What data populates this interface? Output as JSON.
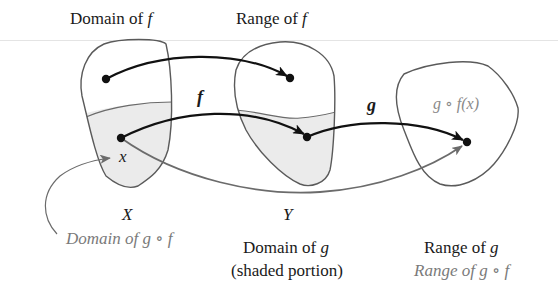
{
  "diagram": {
    "title_domain_f": {
      "text": "Domain of ",
      "var": "f"
    },
    "title_range_f": {
      "text": "Range of ",
      "var": "f"
    },
    "function_labels": {
      "f": "f",
      "g": "g"
    },
    "point_labels": {
      "x": "x",
      "gof_x": "g ∘ f(x)"
    },
    "set_labels": {
      "X": "X",
      "Y": "Y"
    },
    "captions": {
      "domain_gof": "Domain of g ∘ f",
      "domain_g_line1": {
        "text": "Domain of ",
        "var": "g"
      },
      "domain_g_line2": "(shaded portion)",
      "range_g": {
        "text": "Range of ",
        "var": "g"
      },
      "range_gof": "Range of g ∘ f"
    },
    "colors": {
      "outline": "#5a5a5a",
      "shade": "#ebebeb",
      "arrow_primary": "#111111",
      "arrow_secondary": "#6b6b6b",
      "secondary_text": "#7a7a7a"
    }
  }
}
